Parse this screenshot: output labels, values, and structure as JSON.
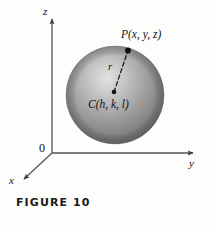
{
  "figure": {
    "caption": "FIGURE 10",
    "background_color": "#fdfdfc",
    "axis_color": "#4a4a4a",
    "ink_color": "#111111"
  },
  "axes": {
    "z_label": "z",
    "y_label": "y",
    "x_label": "x",
    "origin_label": "0"
  },
  "sphere": {
    "center_px": {
      "x": 115,
      "y": 95
    },
    "radius_px": 49,
    "fill_light": "#d8d8d8",
    "fill_mid": "#9a9a9a",
    "fill_dark": "#6e6e6e",
    "highlight_px": {
      "x": 93,
      "y": 70
    }
  },
  "annotations": {
    "point_p_label": "P(x, y, z)",
    "center_label": "C(h, k, l)",
    "radius_label": "r",
    "point_p_px": {
      "x": 128,
      "y": 51
    },
    "center_px": {
      "x": 114,
      "y": 92
    }
  }
}
